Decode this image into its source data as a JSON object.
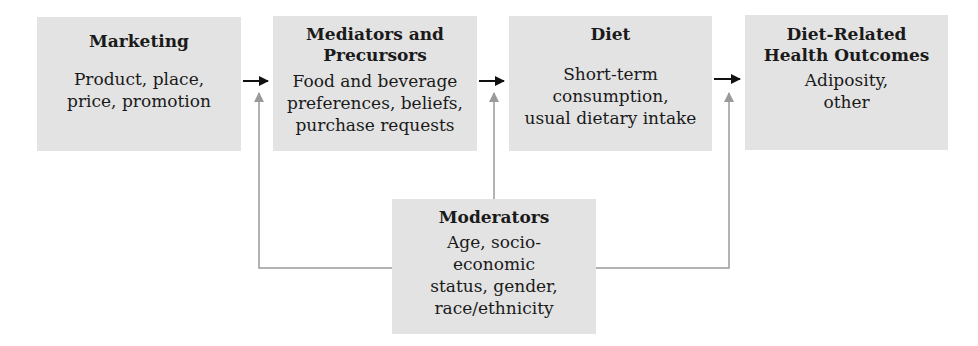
{
  "diagram": {
    "boxes": {
      "marketing": {
        "title": "Marketing",
        "lines": [
          "Product, place,",
          "price, promotion"
        ]
      },
      "mediators": {
        "title_lines": [
          "Mediators and",
          "Precursors"
        ],
        "lines": [
          "Food and beverage",
          "preferences, beliefs,",
          "purchase requests"
        ]
      },
      "diet": {
        "title": "Diet",
        "lines": [
          "Short-term",
          "consumption,",
          "usual dietary intake"
        ]
      },
      "outcomes": {
        "title_lines": [
          "Diet-Related",
          "Health Outcomes"
        ],
        "lines": [
          "Adiposity,",
          "other"
        ]
      },
      "moderators": {
        "title": "Moderators",
        "lines": [
          "Age, socio-",
          "economic",
          "status, gender,",
          "race/ethnicity"
        ]
      }
    },
    "edges": [
      {
        "from": "marketing",
        "to": "mediators",
        "color": "#111111"
      },
      {
        "from": "mediators",
        "to": "diet",
        "color": "#111111"
      },
      {
        "from": "diet",
        "to": "outcomes",
        "color": "#111111"
      },
      {
        "from": "moderators",
        "to": "marketing-mediators-link",
        "color": "#9a9a9a"
      },
      {
        "from": "moderators",
        "to": "mediators-diet-link",
        "color": "#9a9a9a"
      },
      {
        "from": "moderators",
        "to": "diet-outcomes-link",
        "color": "#9a9a9a"
      }
    ],
    "colors": {
      "box_fill": "#e3e3e3",
      "main_arrow": "#111111",
      "moderator_arrow": "#9a9a9a"
    }
  }
}
